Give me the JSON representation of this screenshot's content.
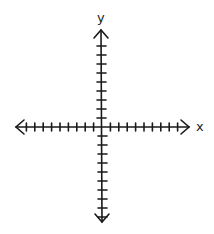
{
  "diagram": {
    "type": "cartesian-axes",
    "x_axis": {
      "label": "x",
      "ticks_negative": 9,
      "ticks_positive": 9
    },
    "y_axis": {
      "label": "y",
      "ticks_negative": 10,
      "ticks_positive": 9
    },
    "origin": {
      "px": 102,
      "py": 127
    },
    "stroke_color": "#1a1a1a",
    "background": "#ffffff"
  }
}
